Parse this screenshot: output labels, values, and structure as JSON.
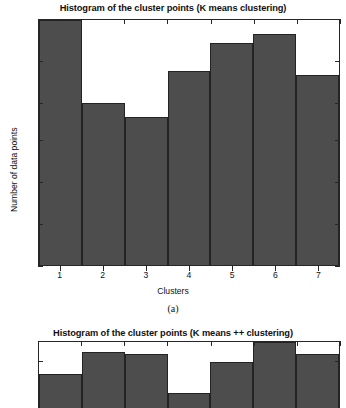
{
  "figure": {
    "background": "#ffffff",
    "bar_color": "#4d4d4d",
    "axis_color": "#262626"
  },
  "chart_data": [
    {
      "type": "bar",
      "title": "Histogram of the cluster points (K means clustering)",
      "xlabel": "Clusters",
      "ylabel": "Number of data points",
      "categories": [
        "1",
        "2",
        "3",
        "4",
        "5",
        "6",
        "7"
      ],
      "values": [
        53,
        35,
        32,
        42,
        48,
        50,
        41
      ],
      "yticks": [
        0,
        9,
        18,
        27,
        35,
        44,
        53
      ],
      "ylim": [
        0,
        53
      ],
      "xticks": [
        "1",
        "2",
        "3",
        "4",
        "5",
        "6",
        "7"
      ],
      "grid": false,
      "legend": null,
      "subcaption": "(a)"
    },
    {
      "type": "bar",
      "title": "Histogram of the cluster points (K means ++ clustering)",
      "xlabel": "",
      "ylabel": "",
      "categories": [
        "1",
        "2",
        "3",
        "4",
        "5",
        "6",
        "7"
      ],
      "values": [
        38,
        47,
        46,
        30,
        43,
        51,
        46
      ],
      "yticks": [
        43,
        51
      ],
      "ylim": [
        24,
        51
      ],
      "xticks": [],
      "grid": false,
      "legend": null,
      "subcaption": "",
      "note_cropped": "chart is cut off at the bottom edge of the screenshot"
    }
  ]
}
